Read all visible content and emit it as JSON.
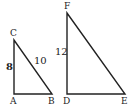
{
  "diagram": {
    "triangles": [
      {
        "name": "ABC",
        "right_angle_at": "A",
        "vertices": {
          "A": "A",
          "B": "B",
          "C": "C"
        },
        "side_labels": {
          "AC": "8",
          "BC": "10"
        }
      },
      {
        "name": "DEF",
        "right_angle_at": "D",
        "vertices": {
          "D": "D",
          "E": "E",
          "F": "F"
        },
        "side_labels": {
          "DF": "12"
        }
      }
    ],
    "stroke_color": "#222222",
    "background": "#ffffff"
  }
}
